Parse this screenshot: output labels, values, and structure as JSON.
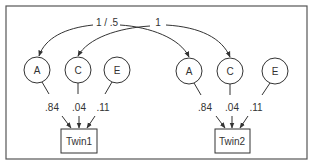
{
  "diagram": {
    "type": "ACE twin model path diagram",
    "correlation_labels": {
      "A_correlation": "1 / .5",
      "C_correlation": "1"
    },
    "twin1": {
      "label": "Twin1",
      "factors": [
        {
          "name": "A",
          "path_label": ".84"
        },
        {
          "name": "C",
          "path_label": ".04"
        },
        {
          "name": "E",
          "path_label": ".11"
        }
      ]
    },
    "twin2": {
      "label": "Twin2",
      "factors": [
        {
          "name": "A",
          "path_label": ".84"
        },
        {
          "name": "C",
          "path_label": ".04"
        },
        {
          "name": "E",
          "path_label": ".11"
        }
      ]
    },
    "colors": {
      "stroke": "#333333",
      "frame": "#555555",
      "background": "#ffffff"
    }
  }
}
